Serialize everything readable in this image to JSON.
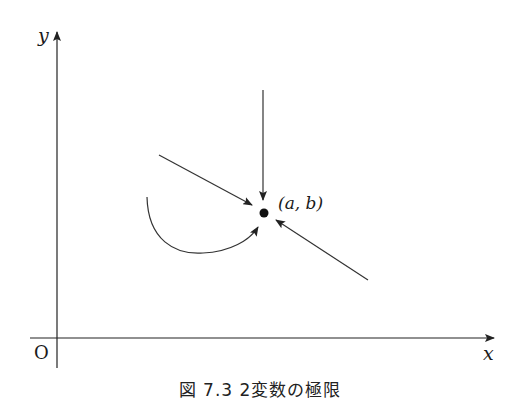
{
  "figure": {
    "axes": {
      "x_label": "x",
      "y_label": "y",
      "origin_label": "O"
    },
    "point": {
      "label": "(a, b)",
      "icon": "filled-dot"
    },
    "arrows": [
      {
        "name": "from-top",
        "type": "straight",
        "direction": "downward toward point"
      },
      {
        "name": "from-upper-left",
        "type": "straight",
        "direction": "down-right toward point"
      },
      {
        "name": "from-lower-right",
        "type": "straight",
        "direction": "up-left toward point"
      },
      {
        "name": "from-left-curved",
        "type": "curved",
        "direction": "curving from left up toward point"
      }
    ],
    "caption": "図 7.3  2変数の極限"
  }
}
